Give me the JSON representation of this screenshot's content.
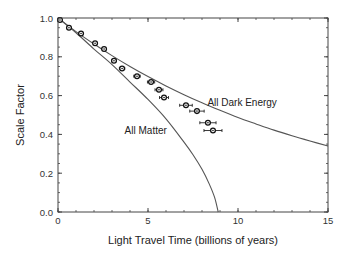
{
  "chart_data": {
    "type": "scatter",
    "title": "",
    "xlabel": "Light Travel Time (billions of years)",
    "ylabel": "Scale Factor",
    "xlim": [
      0,
      15
    ],
    "ylim": [
      0.0,
      1.0
    ],
    "xticks": [
      0,
      5,
      10,
      15
    ],
    "xtick_labels": [
      "0",
      "5",
      "10",
      "15"
    ],
    "xminor_step": 1,
    "yticks": [
      0.0,
      0.2,
      0.4,
      0.6,
      0.8,
      1.0
    ],
    "ytick_labels": [
      "0.0",
      "0.2",
      "0.4",
      "0.6",
      "0.8",
      "1.0"
    ],
    "yminor_step": 0.05,
    "grid": false,
    "legend": null,
    "series": [
      {
        "name": "Observed supernovae",
        "kind": "points_with_xerr",
        "marker": "open-diamond",
        "x": [
          0.11,
          0.61,
          1.28,
          2.06,
          2.56,
          3.11,
          3.56,
          4.39,
          5.17,
          5.61,
          5.89,
          7.11,
          7.72,
          8.33,
          8.61
        ],
        "y": [
          0.99,
          0.95,
          0.92,
          0.87,
          0.84,
          0.78,
          0.74,
          0.7,
          0.67,
          0.63,
          0.59,
          0.55,
          0.52,
          0.46,
          0.42
        ],
        "xerr": [
          0.05,
          0.05,
          0.08,
          0.1,
          0.1,
          0.12,
          0.15,
          0.18,
          0.2,
          0.22,
          0.25,
          0.35,
          0.4,
          0.45,
          0.5
        ]
      },
      {
        "name": "All Dark Energy",
        "kind": "line",
        "x": [
          0,
          1,
          2,
          3,
          4,
          5,
          6,
          7,
          8,
          9,
          10,
          11,
          12,
          13,
          14,
          15
        ],
        "y": [
          1.0,
          0.93,
          0.866,
          0.806,
          0.75,
          0.698,
          0.65,
          0.605,
          0.563,
          0.524,
          0.487,
          0.454,
          0.422,
          0.393,
          0.366,
          0.34
        ]
      },
      {
        "name": "All Matter",
        "kind": "line",
        "x": [
          0,
          1,
          2,
          3,
          4,
          5,
          6,
          7,
          7.5,
          8,
          8.4,
          8.7,
          8.9
        ],
        "y": [
          1.0,
          0.924,
          0.84,
          0.76,
          0.67,
          0.58,
          0.48,
          0.36,
          0.295,
          0.22,
          0.145,
          0.075,
          0.0
        ]
      }
    ],
    "annotations": [
      {
        "text": "All Dark Energy",
        "x": 8.3,
        "y": 0.56
      },
      {
        "text": "All Matter",
        "x": 3.7,
        "y": 0.42
      }
    ]
  }
}
